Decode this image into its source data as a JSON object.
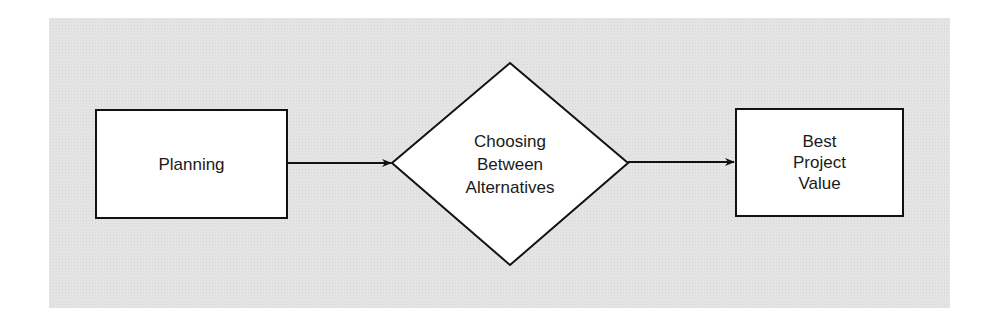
{
  "diagram": {
    "background_color": "#e4e4e4",
    "nodes": [
      {
        "id": "planning",
        "shape": "rectangle",
        "lines": [
          "Planning"
        ]
      },
      {
        "id": "choosing",
        "shape": "diamond",
        "lines": [
          "Choosing",
          "Between",
          "Alternatives"
        ]
      },
      {
        "id": "best",
        "shape": "rectangle",
        "lines": [
          "Best",
          "Project",
          "Value"
        ]
      }
    ],
    "edges": [
      {
        "from": "planning",
        "to": "choosing"
      },
      {
        "from": "choosing",
        "to": "best"
      }
    ]
  }
}
